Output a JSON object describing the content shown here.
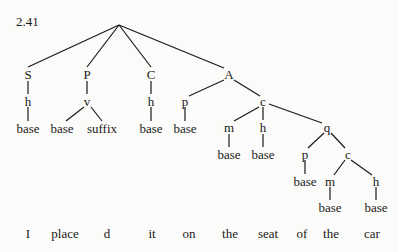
{
  "figure_number": "2.41",
  "nodes": {
    "S": "S",
    "P": "P",
    "C": "C",
    "A": "A",
    "S_h": "h",
    "P_v": "v",
    "C_h": "h",
    "A_p": "p",
    "A_c": "c",
    "S_h_base": "base",
    "P_v_base": "base",
    "P_v_suffix": "suffix",
    "C_h_base": "base",
    "A_p_base": "base",
    "c_m": "m",
    "c_h": "h",
    "c_q": "q",
    "c_m_base": "base",
    "c_h_base": "base",
    "q_p": "p",
    "q_c": "c",
    "q_p_base": "base",
    "qc_m": "m",
    "qc_h": "h",
    "qc_m_base": "base",
    "qc_h_base": "base"
  },
  "words": [
    "I",
    "place",
    "d",
    "it",
    "on",
    "the",
    "seat",
    "of",
    "the",
    "car"
  ]
}
